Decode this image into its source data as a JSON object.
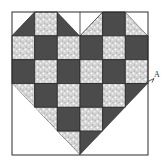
{
  "diagram": {
    "type": "quilt-block",
    "grid": {
      "cols": 6,
      "rows": 6
    },
    "frame": {
      "x": 12,
      "y": 12,
      "width": 136,
      "height": 143
    },
    "colors": {
      "dark": "#4b4b4b",
      "print": "#d6d6d6",
      "print_speck": "#ffffff",
      "white": "#ffffff",
      "line": "#2a2a2a"
    },
    "cells": [
      [
        "tri:W-ul:D-lr",
        "P",
        "tri:D-ll:W-ur",
        "tri:W-ul:P-lr",
        "D",
        "tri:P-ll:W-ur"
      ],
      [
        "P",
        "D",
        "P",
        "D",
        "P",
        "D"
      ],
      [
        "D",
        "P",
        "D",
        "P",
        "D",
        "P"
      ],
      [
        "tri:P-ur:W-ll",
        "D",
        "P",
        "D",
        "P",
        "tri:D-ul:W-lr"
      ],
      [
        "W",
        "tri:P-ur:W-ll",
        "D",
        "P",
        "tri:D-ul:W-lr",
        "W"
      ],
      [
        "W",
        "W",
        "tri:P-ur:W-ll",
        "tri:D-ul:W-lr",
        "W",
        "W"
      ]
    ],
    "annotation": {
      "label": "A"
    }
  }
}
